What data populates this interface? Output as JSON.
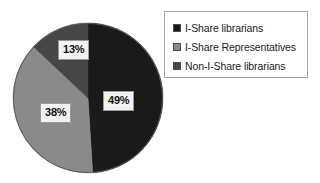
{
  "chart_data": {
    "type": "pie",
    "title": "",
    "subtitle": "",
    "xlabel": "",
    "ylabel": "",
    "grid": false,
    "legend_position": "right",
    "categories": [
      "I-Share librarians",
      "I-Share Representatives",
      "Non-I-Share librarians"
    ],
    "values": [
      49,
      38,
      13
    ],
    "value_unit": "%",
    "data_labels": [
      "49%",
      "38%",
      "13%"
    ],
    "colors": [
      "#1a1a1a",
      "#8a8a8a",
      "#464646"
    ],
    "start_angle_deg": 0,
    "direction": "clockwise"
  },
  "legend": {
    "items": [
      {
        "label": "I-Share librarians",
        "color": "#1a1a1a"
      },
      {
        "label": "I-Share Representatives",
        "color": "#8a8a8a"
      },
      {
        "label": "Non-I-Share librarians",
        "color": "#464646"
      }
    ]
  },
  "pie": {
    "slices": [
      {
        "label": "I-Share librarians",
        "value": 49,
        "data_label": "49%",
        "color": "#1a1a1a"
      },
      {
        "label": "I-Share Representatives",
        "value": 38,
        "data_label": "38%",
        "color": "#8a8a8a"
      },
      {
        "label": "Non-I-Share librarians",
        "value": 13,
        "data_label": "13%",
        "color": "#464646"
      }
    ],
    "outline_color": "#5a5a5a"
  }
}
